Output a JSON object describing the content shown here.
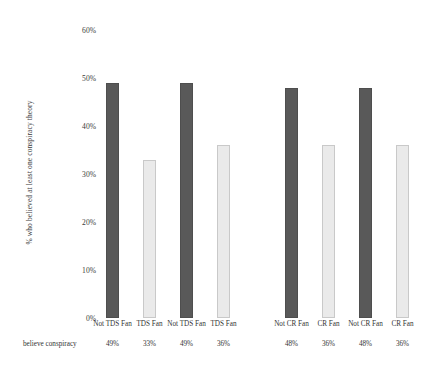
{
  "chart_data": {
    "type": "bar",
    "title": "",
    "subtitle": "",
    "xlabel": "",
    "ylabel": "% who believed at least one conspiracy theory",
    "ylim": [
      0,
      60
    ],
    "ytick_labels": [
      "0%",
      "10%",
      "20%",
      "30%",
      "40%",
      "50%",
      "60%"
    ],
    "ytick_values": [
      0,
      10,
      20,
      30,
      40,
      50,
      60
    ],
    "grid": false,
    "legend": "none",
    "row_label": "believe conspiracy",
    "categories": [
      "Not TDS Fan",
      "TDS Fan",
      "Not TDS Fan",
      "TDS Fan",
      "Not CR Fan",
      "CR Fan",
      "Not CR Fan",
      "CR Fan"
    ],
    "values": [
      49,
      33,
      49,
      36,
      48,
      36,
      48,
      36
    ],
    "value_labels": [
      "49%",
      "33%",
      "49%",
      "36%",
      "48%",
      "36%",
      "48%",
      "36%"
    ],
    "bar_styles": [
      "dark",
      "light",
      "dark",
      "light",
      "dark",
      "light",
      "dark",
      "light"
    ],
    "groups": [
      {
        "name": "TDS",
        "bar_indices": [
          0,
          1,
          2,
          3
        ]
      },
      {
        "name": "CR",
        "bar_indices": [
          4,
          5,
          6,
          7
        ]
      }
    ],
    "colors": {
      "dark_bar": "#595959",
      "dark_bar_border": "#4e4e4e",
      "light_bar": "#eaeaea",
      "light_bar_border": "#c9c9c9",
      "text": "#333333",
      "background": "#ffffff"
    }
  }
}
